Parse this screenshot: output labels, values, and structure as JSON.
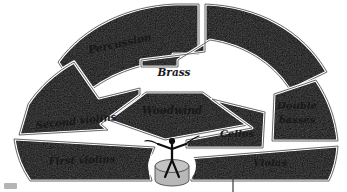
{
  "diagram": {
    "type": "fan-shaped orchestra seating chart",
    "background_color": "#ffffff",
    "outline_color": "#59595c",
    "divider_color": "#ffffff",
    "sections": [
      {
        "id": "percussion",
        "label": "Percussion",
        "fill": "#a5a5a6",
        "label_x": 120,
        "label_y": 44,
        "label_size": 10.5,
        "label_rotate": -12,
        "lines": [
          "Percussion"
        ]
      },
      {
        "id": "brass",
        "label": "Brass",
        "fill": "#dcdcdc",
        "label_x": 172,
        "label_y": 72,
        "label_size": 10.5,
        "label_rotate": 0,
        "lines": [
          "Brass"
        ]
      },
      {
        "id": "woodwind",
        "label": "Woodwind",
        "fill": "#a9a9aa",
        "label_x": 172,
        "label_y": 110,
        "label_size": 10.5,
        "label_rotate": 0,
        "lines": [
          "Woodwind"
        ]
      },
      {
        "id": "second-violins",
        "label": "Second violins",
        "fill": "#b0b0b1",
        "label_x": 75,
        "label_y": 122,
        "label_size": 10,
        "label_rotate": -6,
        "lines": [
          "Second violins"
        ]
      },
      {
        "id": "first-violins",
        "label": "First violins",
        "fill": "#a9a9aa",
        "label_x": 82,
        "label_y": 158,
        "label_size": 10,
        "label_rotate": -3,
        "lines": [
          "First violins"
        ]
      },
      {
        "id": "cellos",
        "label": "Cellos",
        "fill": "#a7a7a8",
        "label_x": 237,
        "label_y": 133,
        "label_size": 10,
        "label_rotate": 0,
        "lines": [
          "Cellos"
        ]
      },
      {
        "id": "double-basses",
        "label": "Double basses",
        "fill": "#cfcfcf",
        "label_x": 297,
        "label_y": 112,
        "label_size": 10,
        "label_rotate": 0,
        "lines": [
          "Double",
          "basses"
        ]
      },
      {
        "id": "violas",
        "label": "Violas",
        "fill": "#a2a2a3",
        "label_x": 270,
        "label_y": 161,
        "label_size": 10,
        "label_rotate": 0,
        "lines": [
          "Violas"
        ]
      }
    ],
    "conductor": {
      "id": "conductor",
      "label": "conductor figure on podium",
      "podium_fill": "#b8b8b8",
      "figure_color": "#0d0d0f"
    },
    "leader_line": {
      "id": "violas-leader-line",
      "label": "callout leader line from Violas",
      "color": "#3a3a3c"
    },
    "corner_mark": {
      "id": "corner-mark",
      "label": "page corner mark",
      "color": "#b5b5b5"
    }
  }
}
